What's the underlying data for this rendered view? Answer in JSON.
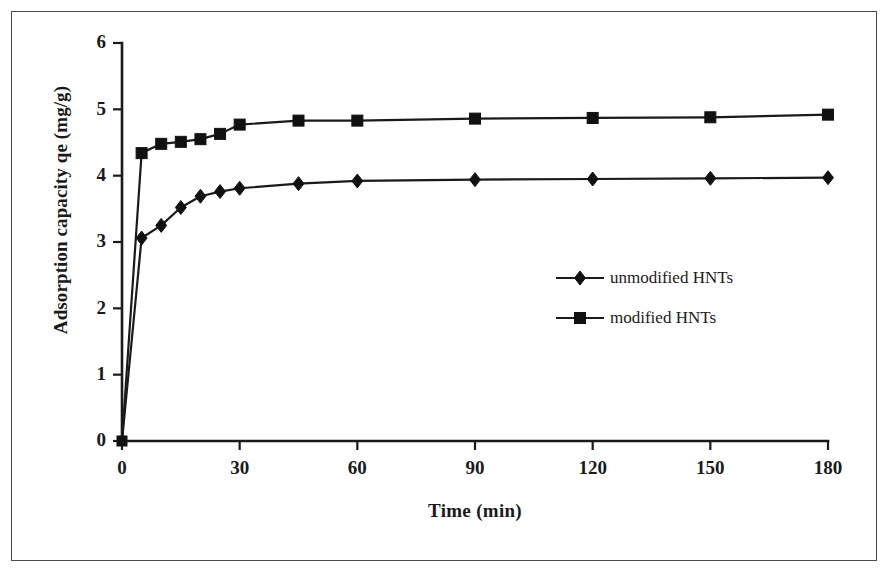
{
  "chart_data": {
    "type": "line",
    "title": "",
    "xlabel": "Time (min)",
    "ylabel": "Adsorption capacity qe (mg/g)",
    "xlim": [
      0,
      180
    ],
    "ylim": [
      0,
      6
    ],
    "xticks": [
      0,
      30,
      60,
      90,
      120,
      150,
      180
    ],
    "yticks": [
      0,
      1,
      2,
      3,
      4,
      5,
      6
    ],
    "xtick_labels": [
      "0",
      "30",
      "60",
      "90",
      "120",
      "150",
      "180"
    ],
    "ytick_labels": [
      "0",
      "1",
      "2",
      "3",
      "4",
      "5",
      "6"
    ],
    "grid": false,
    "legend_position": "center-right",
    "series": [
      {
        "name": "unmodified HNTs",
        "marker": "diamond",
        "color": "#111111",
        "x": [
          0,
          5,
          10,
          15,
          20,
          25,
          30,
          45,
          60,
          90,
          120,
          150,
          180
        ],
        "values": [
          0,
          3.06,
          3.25,
          3.52,
          3.69,
          3.76,
          3.81,
          3.88,
          3.92,
          3.94,
          3.95,
          3.96,
          3.97
        ]
      },
      {
        "name": "modified HNTs",
        "marker": "square",
        "color": "#111111",
        "x": [
          0,
          5,
          10,
          15,
          20,
          25,
          30,
          45,
          60,
          90,
          120,
          150,
          180
        ],
        "values": [
          0,
          4.34,
          4.48,
          4.51,
          4.55,
          4.63,
          4.77,
          4.83,
          4.83,
          4.86,
          4.87,
          4.88,
          4.92
        ]
      }
    ]
  },
  "legend": {
    "entries": [
      {
        "label": "unmodified HNTs",
        "marker": "diamond-marker"
      },
      {
        "label": "modified HNTs",
        "marker": "square-marker"
      }
    ]
  },
  "axes": {
    "x_title": "Time (min)",
    "y_title": "Adsorption capacity qe (mg/g)"
  }
}
